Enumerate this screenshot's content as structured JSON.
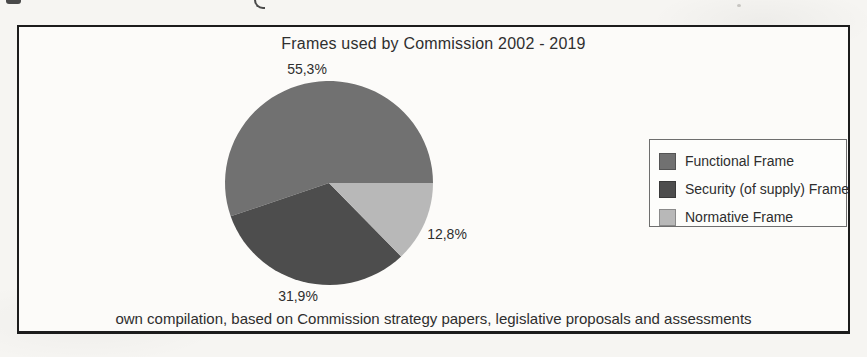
{
  "chart_data": {
    "type": "pie",
    "title": "Frames used by Commission 2002 - 2019",
    "caption": "own compilation, based on Commission strategy papers, legislative proposals and assessments",
    "start_angle_deg": 0,
    "direction": "counterclockwise",
    "total": 100.0,
    "legend_position": "right",
    "slices": [
      {
        "label": "Functional Frame",
        "value": 55.3,
        "display": "55,3%",
        "color": "#717171"
      },
      {
        "label": "Security (of supply) Frame",
        "value": 31.9,
        "display": "31,9%",
        "color": "#4d4d4d"
      },
      {
        "label": "Normative Frame",
        "value": 12.8,
        "display": "12,8%",
        "color": "#b8b8b8"
      }
    ]
  },
  "colors": {
    "figure_border": "#1c1c1c",
    "legend_border": "#6e6e6e",
    "text": "#2e2e2e",
    "paper": "#f6f5f2"
  }
}
